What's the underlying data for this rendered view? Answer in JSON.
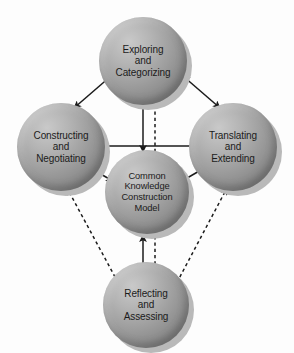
{
  "diagram": {
    "title": "Common Knowledge Construction Model",
    "type": "cycle-diagram",
    "background_color": "#fdfdfd",
    "node_fill_color": "#9e9e9e",
    "node_shadow_color": "#b9b9b9",
    "text_color": "#1b1b1b",
    "edge_color": "#1b1b1b",
    "nodes": [
      {
        "id": "exploring",
        "label": "Exploring\nand\nCategorizing",
        "role": "phase",
        "position": "top"
      },
      {
        "id": "constructing",
        "label": "Constructing\nand\nNegotiating",
        "role": "phase",
        "position": "left"
      },
      {
        "id": "translating",
        "label": "Translating\nand\nExtending",
        "role": "phase",
        "position": "right"
      },
      {
        "id": "center",
        "label": "Common\nKnowledge\nConstruction\nModel",
        "role": "core",
        "position": "center"
      },
      {
        "id": "reflecting",
        "label": "Reflecting\nand\nAssessing",
        "role": "phase",
        "position": "bottom"
      }
    ],
    "edges": [
      {
        "id": "constructing-exploring",
        "from": "constructing",
        "to": "exploring",
        "style": "solid",
        "arrows": "both"
      },
      {
        "id": "exploring-translating",
        "from": "exploring",
        "to": "translating",
        "style": "solid",
        "arrows": "both"
      },
      {
        "id": "constructing-translating",
        "from": "constructing",
        "to": "translating",
        "style": "solid",
        "arrows": "both"
      },
      {
        "id": "exploring-center",
        "from": "exploring",
        "to": "center",
        "style": "solid",
        "arrows": "end"
      },
      {
        "id": "center-exploring-dashed",
        "from": "center",
        "to": "exploring",
        "style": "dashed",
        "arrows": "end"
      },
      {
        "id": "constructing-center",
        "from": "constructing",
        "to": "center",
        "style": "solid",
        "arrows": "end"
      },
      {
        "id": "translating-center",
        "from": "translating",
        "to": "center",
        "style": "solid",
        "arrows": "end"
      },
      {
        "id": "reflecting-center",
        "from": "reflecting",
        "to": "center",
        "style": "solid",
        "arrows": "end"
      },
      {
        "id": "reflecting-center-dashed",
        "from": "reflecting",
        "to": "center",
        "style": "dashed",
        "arrows": "none"
      },
      {
        "id": "reflecting-constructing",
        "from": "reflecting",
        "to": "constructing",
        "style": "dashed",
        "arrows": "end"
      },
      {
        "id": "reflecting-translating",
        "from": "reflecting",
        "to": "translating",
        "style": "dashed",
        "arrows": "end"
      }
    ]
  }
}
